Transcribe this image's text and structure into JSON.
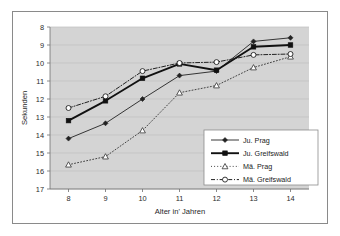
{
  "chart_data": {
    "type": "line",
    "title": "",
    "xlabel": "Alter in' Jahren",
    "ylabel": "Sekunden",
    "x": [
      8,
      9,
      10,
      11,
      12,
      13,
      14
    ],
    "xticklabels": [
      "8",
      "9",
      "10",
      "11",
      "12",
      "13",
      "14"
    ],
    "yticklabels": [
      "8",
      "9",
      "10",
      "11",
      "12",
      "13",
      "14",
      "15",
      "16",
      "17"
    ],
    "xlim": [
      7.5,
      14.5
    ],
    "ylim": [
      17,
      8
    ],
    "y_axis_inverted": true,
    "grid": "horizontal",
    "legend_position": "lower-right-inside",
    "plot_background": "#d4d4d4",
    "series": [
      {
        "name": "Ju. Prag",
        "marker": "filled-diamond",
        "line_style": "solid-thin",
        "color": "#222222",
        "values": [
          14.2,
          13.35,
          12.0,
          10.7,
          10.45,
          8.8,
          8.6
        ]
      },
      {
        "name": "Ju. Greifswald",
        "marker": "filled-square",
        "line_style": "solid-thick",
        "color": "#111111",
        "values": [
          13.2,
          12.1,
          10.85,
          10.05,
          10.4,
          9.1,
          9.0
        ]
      },
      {
        "name": "Mä. Prag",
        "marker": "open-triangle",
        "line_style": "dotted",
        "color": "#333333",
        "values": [
          15.65,
          15.2,
          13.75,
          11.65,
          11.25,
          10.25,
          9.65
        ]
      },
      {
        "name": "Mä. Greifswald",
        "marker": "open-circle",
        "line_style": "dash-dot",
        "color": "#222222",
        "values": [
          12.5,
          11.85,
          10.45,
          10.0,
          9.95,
          9.55,
          9.5
        ]
      }
    ]
  },
  "legend": {
    "items": [
      {
        "label": "Ju. Prag"
      },
      {
        "label": "Ju. Greifswald"
      },
      {
        "label": "Mä. Prag"
      },
      {
        "label": "Mä. Greifswald"
      }
    ]
  }
}
